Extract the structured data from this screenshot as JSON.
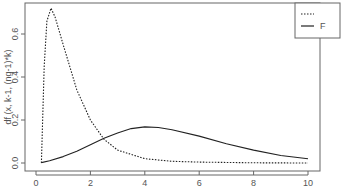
{
  "chart_data": {
    "type": "line",
    "title": "",
    "xlabel": "",
    "ylabel": "df (x, k-1, (ng-1)*k)",
    "xlim": [
      0,
      10
    ],
    "ylim": [
      0,
      0.73
    ],
    "x_ticks": [
      "0",
      "2",
      "4",
      "6",
      "8",
      "10"
    ],
    "y_ticks": [
      "0.0",
      "0.2",
      "0.4",
      "0.6"
    ],
    "grid": false,
    "legend_position": "top-right",
    "series": [
      {
        "name": "",
        "style": "dotted",
        "x": [
          0.2,
          0.3,
          0.4,
          0.55,
          0.7,
          1.0,
          1.5,
          2.0,
          2.5,
          3.0,
          4.0,
          5.0,
          6.0,
          8.0,
          10.0
        ],
        "values": [
          0.0,
          0.45,
          0.66,
          0.72,
          0.68,
          0.55,
          0.34,
          0.2,
          0.11,
          0.06,
          0.02,
          0.008,
          0.004,
          0.001,
          0.0
        ]
      },
      {
        "name": "F",
        "style": "solid",
        "x": [
          0.2,
          0.5,
          1.0,
          1.5,
          2.0,
          2.5,
          3.0,
          3.5,
          4.0,
          4.5,
          5.0,
          6.0,
          7.0,
          8.0,
          9.0,
          10.0
        ],
        "values": [
          0.002,
          0.01,
          0.03,
          0.055,
          0.085,
          0.115,
          0.14,
          0.16,
          0.168,
          0.165,
          0.155,
          0.125,
          0.09,
          0.06,
          0.035,
          0.02
        ]
      }
    ]
  },
  "legend": {
    "entries": [
      {
        "label": "",
        "style": "dotted"
      },
      {
        "label": "F",
        "style": "solid"
      }
    ]
  }
}
